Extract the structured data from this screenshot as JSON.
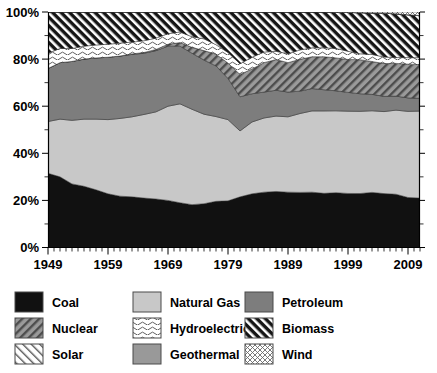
{
  "chart_data": {
    "type": "area",
    "title": "",
    "subtitle": "",
    "xlabel": "",
    "ylabel": "",
    "stacked": true,
    "stack_mode": "percent",
    "grid": false,
    "legend_position": "bottom",
    "xlim": [
      1949,
      2011
    ],
    "ylim": [
      0,
      100
    ],
    "ytick_labels": [
      "0%",
      "20%",
      "40%",
      "60%",
      "80%",
      "100%"
    ],
    "ytick_values": [
      0,
      20,
      40,
      60,
      80,
      100
    ],
    "xtick_labels": [
      "1949",
      "1959",
      "1969",
      "1979",
      "1989",
      "1999",
      "2009"
    ],
    "xtick_values": [
      1949,
      1959,
      1969,
      1979,
      1989,
      1999,
      2009
    ],
    "minor_tick_interval": 1,
    "x": [
      1949,
      1951,
      1953,
      1955,
      1957,
      1959,
      1961,
      1963,
      1965,
      1967,
      1969,
      1971,
      1973,
      1975,
      1977,
      1979,
      1981,
      1983,
      1985,
      1987,
      1989,
      1991,
      1993,
      1995,
      1997,
      1999,
      2001,
      2003,
      2005,
      2007,
      2009,
      2011
    ],
    "series": [
      {
        "name": "Coal",
        "color": "#111111",
        "pattern": "solid",
        "values": [
          31.5,
          30.0,
          27.0,
          26.0,
          24.5,
          22.8,
          21.8,
          21.5,
          21.0,
          20.6,
          20.0,
          19.0,
          18.2,
          18.6,
          19.6,
          19.8,
          21.5,
          22.8,
          23.5,
          23.8,
          23.5,
          23.4,
          23.5,
          23.0,
          23.3,
          23.0,
          23.0,
          23.5,
          23.0,
          22.8,
          21.5,
          21.3
        ]
      },
      {
        "name": "Natural Gas",
        "color": "#c8c8c8",
        "pattern": "solid",
        "values": [
          22.0,
          24.5,
          27.0,
          28.5,
          30.0,
          31.5,
          33.0,
          34.0,
          35.5,
          37.0,
          40.0,
          42.0,
          40.5,
          38.0,
          36.0,
          34.5,
          28.0,
          30.5,
          31.5,
          32.0,
          32.0,
          33.5,
          34.5,
          35.0,
          34.8,
          35.0,
          35.0,
          34.8,
          35.0,
          36.0,
          37.0,
          37.5
        ]
      },
      {
        "name": "Petroleum",
        "color": "#7d7d7d",
        "pattern": "solid",
        "values": [
          22.5,
          24.0,
          25.0,
          25.5,
          26.0,
          26.5,
          26.5,
          26.5,
          26.0,
          26.0,
          25.5,
          24.5,
          23.8,
          23.0,
          21.5,
          17.5,
          14.5,
          12.0,
          11.0,
          11.0,
          10.5,
          9.5,
          9.5,
          9.0,
          8.5,
          8.0,
          7.5,
          7.0,
          6.5,
          6.0,
          5.8,
          5.5
        ]
      },
      {
        "name": "Nuclear",
        "color": "#8c8c8c",
        "pattern": "diagonal-dark",
        "values": [
          0.0,
          0.0,
          0.0,
          0.0,
          0.0,
          0.0,
          0.0,
          0.2,
          0.3,
          0.5,
          0.8,
          1.5,
          2.5,
          4.0,
          5.0,
          6.5,
          9.5,
          10.5,
          12.5,
          13.0,
          12.5,
          13.5,
          13.5,
          14.0,
          14.0,
          14.0,
          14.5,
          14.0,
          14.0,
          14.0,
          14.5,
          14.5
        ]
      },
      {
        "name": "Hydroelectric",
        "color": "#f2f2f2",
        "pattern": "wavy",
        "values": [
          6.5,
          6.0,
          5.5,
          5.5,
          5.5,
          5.5,
          5.5,
          5.0,
          5.0,
          4.8,
          4.5,
          4.5,
          4.5,
          5.0,
          4.0,
          4.5,
          4.5,
          5.0,
          4.5,
          3.5,
          3.8,
          4.0,
          3.8,
          3.8,
          4.0,
          3.5,
          2.5,
          3.0,
          2.8,
          2.5,
          2.8,
          3.0
        ]
      },
      {
        "name": "Biomass",
        "color": "#1a1a1a",
        "pattern": "diagonal-white",
        "values": [
          17.5,
          15.5,
          15.5,
          14.5,
          14.0,
          13.7,
          13.2,
          12.8,
          12.2,
          11.1,
          9.2,
          8.5,
          10.5,
          11.4,
          13.9,
          17.2,
          22.0,
          19.2,
          17.0,
          16.7,
          17.7,
          16.1,
          15.2,
          15.2,
          15.4,
          16.5,
          17.5,
          17.7,
          18.7,
          18.7,
          18.4,
          18.2
        ]
      },
      {
        "name": "Geothermal",
        "color": "#999999",
        "pattern": "solid",
        "values": [
          0.0,
          0.0,
          0.0,
          0.0,
          0.0,
          0.0,
          0.0,
          0.0,
          0.0,
          0.0,
          0.0,
          0.0,
          0.0,
          0.0,
          0.0,
          0.0,
          0.0,
          0.0,
          0.0,
          0.0,
          0.0,
          0.0,
          0.0,
          0.0,
          0.0,
          0.0,
          0.0,
          0.0,
          0.0,
          0.0,
          0.0,
          0.0
        ]
      },
      {
        "name": "Solar",
        "color": "#fafafa",
        "pattern": "diagonal-light",
        "values": [
          0.0,
          0.0,
          0.0,
          0.0,
          0.0,
          0.0,
          0.0,
          0.0,
          0.0,
          0.0,
          0.0,
          0.0,
          0.0,
          0.0,
          0.0,
          0.0,
          0.0,
          0.0,
          0.0,
          0.0,
          0.0,
          0.0,
          0.0,
          0.0,
          0.0,
          0.0,
          0.0,
          0.0,
          0.0,
          0.0,
          0.0,
          0.0
        ]
      },
      {
        "name": "Wind",
        "color": "#f7f7f7",
        "pattern": "crosshatch",
        "values": [
          0.0,
          0.0,
          0.0,
          0.0,
          0.0,
          0.0,
          0.0,
          0.0,
          0.0,
          0.0,
          0.0,
          0.0,
          0.0,
          0.0,
          0.0,
          0.0,
          0.0,
          0.0,
          0.0,
          0.0,
          0.0,
          0.0,
          0.0,
          0.0,
          0.1,
          0.2,
          0.3,
          0.4,
          0.5,
          0.8,
          1.2,
          1.5
        ]
      }
    ]
  },
  "legend": {
    "items": [
      {
        "label": "Coal",
        "pattern": "solid",
        "color": "#111111"
      },
      {
        "label": "Natural Gas",
        "pattern": "solid",
        "color": "#c8c8c8"
      },
      {
        "label": "Petroleum",
        "pattern": "solid",
        "color": "#7d7d7d"
      },
      {
        "label": "Nuclear",
        "pattern": "diagonal-dark",
        "color": "#8c8c8c"
      },
      {
        "label": "Hydroelectric",
        "pattern": "wavy",
        "color": "#f2f2f2"
      },
      {
        "label": "Biomass",
        "pattern": "diagonal-white",
        "color": "#1a1a1a"
      },
      {
        "label": "Solar",
        "pattern": "diagonal-light",
        "color": "#fafafa"
      },
      {
        "label": "Geothermal",
        "pattern": "solid",
        "color": "#999999"
      },
      {
        "label": "Wind",
        "pattern": "crosshatch",
        "color": "#f7f7f7"
      }
    ]
  }
}
